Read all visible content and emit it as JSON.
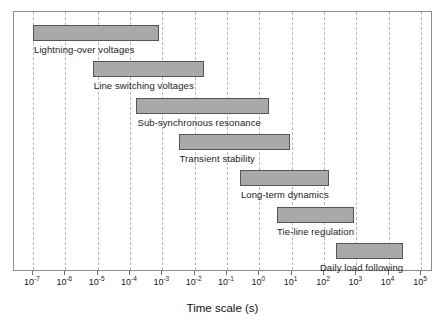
{
  "chart_data": {
    "type": "bar",
    "orientation": "horizontal",
    "title": "",
    "xlabel": "Time scale (s)",
    "ylabel": "",
    "xscale": "log",
    "xlim": [
      1e-07,
      100000.0
    ],
    "grid": true,
    "legend": "none",
    "xtick_labels": [
      "10-7",
      "10-6",
      "10-5",
      "10-4",
      "10-3",
      "10-2",
      "10-1",
      "100",
      "101",
      "102",
      "103",
      "104",
      "105"
    ],
    "xtick_mantissa": "10",
    "xtick_exponents": [
      "-7",
      "-6",
      "-5",
      "-4",
      "-3",
      "-2",
      "-1",
      "0",
      "1",
      "2",
      "3",
      "4",
      "5"
    ],
    "xtick_values": [
      1e-07,
      1e-06,
      1e-05,
      0.0001,
      0.001,
      0.01,
      0.1,
      1,
      10,
      100,
      1000,
      10000,
      100000
    ],
    "bar_fill_color": "#a9a9a9",
    "bar_edge_color": "#555555",
    "grid_color": "#b9b9b9",
    "categories": [
      "Lightning-over voltages",
      "Line switching voltages",
      "Sub-synchronous resonance",
      "Transient stability",
      "Long-term dynamics",
      "Tie-line regulation",
      "Daily load following"
    ],
    "bars": [
      {
        "label": "Lightning-over voltages",
        "start": 1e-07,
        "end": 0.001,
        "start_exp": -7.0,
        "end_exp": -3.1
      },
      {
        "label": "Line switching voltages",
        "start": 1e-05,
        "end": 0.02,
        "start_exp": -5.15,
        "end_exp": -1.7
      },
      {
        "label": "Sub-synchronous resonance",
        "start": 0.0003,
        "end": 2.0,
        "start_exp": -3.8,
        "end_exp": 0.3
      },
      {
        "label": "Transient stability",
        "start": 0.004,
        "end": 10.0,
        "start_exp": -2.5,
        "end_exp": 0.95
      },
      {
        "label": "Long-term dynamics",
        "start": 0.3,
        "end": 300.0,
        "start_exp": -0.6,
        "end_exp": 2.17
      },
      {
        "label": "Tie-line regulation",
        "start": 5.0,
        "end": 1000.0,
        "start_exp": 0.55,
        "end_exp": 2.93
      },
      {
        "label": "Daily load following",
        "start": 300.0,
        "end": 30000.0,
        "start_exp": 2.36,
        "end_exp": 4.45
      }
    ]
  }
}
